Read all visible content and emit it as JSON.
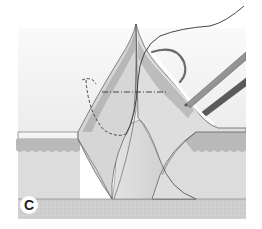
{
  "figure": {
    "panel_label": "C",
    "colors": {
      "background": "#ffffff",
      "upper_field": "#f0f0f0",
      "epidermis": "#e6e6e6",
      "dermis_band": "#b9b9b9",
      "dermis_light": "#d9d9d9",
      "subcutis": "#dadada",
      "fat_base": "#d2d2d2",
      "outline": "#555555",
      "suture": "#333333",
      "instrument": "#8a8a8a"
    }
  }
}
